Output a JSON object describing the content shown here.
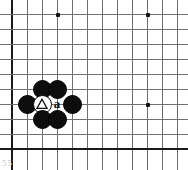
{
  "diagram": {
    "type": "go-board-problem",
    "caption_text": "55",
    "board": {
      "background_color": "#ffffff",
      "line_color": "#6f6f6f",
      "edge_color": "#1a1a1a",
      "columns": 12,
      "rows": 10,
      "cell_size_px": 15,
      "origin_x_px": 12,
      "origin_y_px": 14,
      "left_edge_is_board_border": true,
      "bottom_edge_is_board_border": true
    },
    "star_points": [
      {
        "name": "star-point-top-left",
        "col": 3,
        "row": 0
      },
      {
        "name": "star-point-top-right",
        "col": 9,
        "row": 0
      },
      {
        "name": "star-point-center",
        "col": 9,
        "row": 6
      }
    ],
    "stones": [
      {
        "name": "black-stone-north-west",
        "color": "black",
        "col": 2,
        "row": 5,
        "mark": "none",
        "label": ""
      },
      {
        "name": "black-stone-north-east",
        "color": "black",
        "col": 3,
        "row": 5,
        "mark": "none",
        "label": ""
      },
      {
        "name": "black-stone-west",
        "color": "black",
        "col": 1,
        "row": 6,
        "mark": "none",
        "label": ""
      },
      {
        "name": "white-stone-marked",
        "color": "white",
        "col": 2,
        "row": 6,
        "mark": "triangle",
        "label": ""
      },
      {
        "name": "black-stone-east",
        "color": "black",
        "col": 4,
        "row": 6,
        "mark": "none",
        "label": ""
      },
      {
        "name": "black-stone-south-west",
        "color": "black",
        "col": 2,
        "row": 7,
        "mark": "none",
        "label": ""
      },
      {
        "name": "black-stone-south-east",
        "color": "black",
        "col": 3,
        "row": 7,
        "mark": "none",
        "label": ""
      }
    ],
    "point_labels": [
      {
        "name": "point-label-a",
        "text": "a",
        "col": 3,
        "row": 6
      }
    ],
    "colors": {
      "black_stone": "#0d0d0d",
      "white_stone": "#ffffff",
      "grid_line": "#6f6f6f",
      "board_edge": "#1a1a1a",
      "star_point": "#111111",
      "caption": "#c9c9c9"
    }
  }
}
